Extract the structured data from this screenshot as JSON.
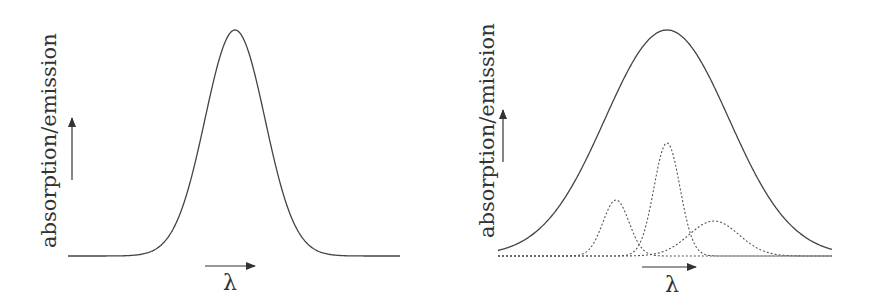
{
  "panels": [
    {
      "id": "left",
      "y_axis_label": "absorption/emission",
      "x_axis_label": "λ",
      "curves": [
        {
          "name": "single-band",
          "style": "solid",
          "center": 235,
          "sigma": 30,
          "height": 226
        }
      ]
    },
    {
      "id": "right",
      "y_axis_label": "absorption/emission",
      "x_axis_label": "λ",
      "curves": [
        {
          "name": "envelope",
          "style": "solid",
          "center": 667,
          "sigma": 62,
          "height": 226
        },
        {
          "name": "component-1",
          "style": "dotted",
          "center": 616,
          "sigma": 13,
          "height": 56
        },
        {
          "name": "component-2",
          "style": "dotted",
          "center": 667,
          "sigma": 13,
          "height": 113
        },
        {
          "name": "component-3",
          "style": "dotted",
          "center": 714,
          "sigma": 25,
          "height": 35
        }
      ]
    }
  ],
  "colors": {
    "line": "#444444",
    "text": "#333333"
  }
}
